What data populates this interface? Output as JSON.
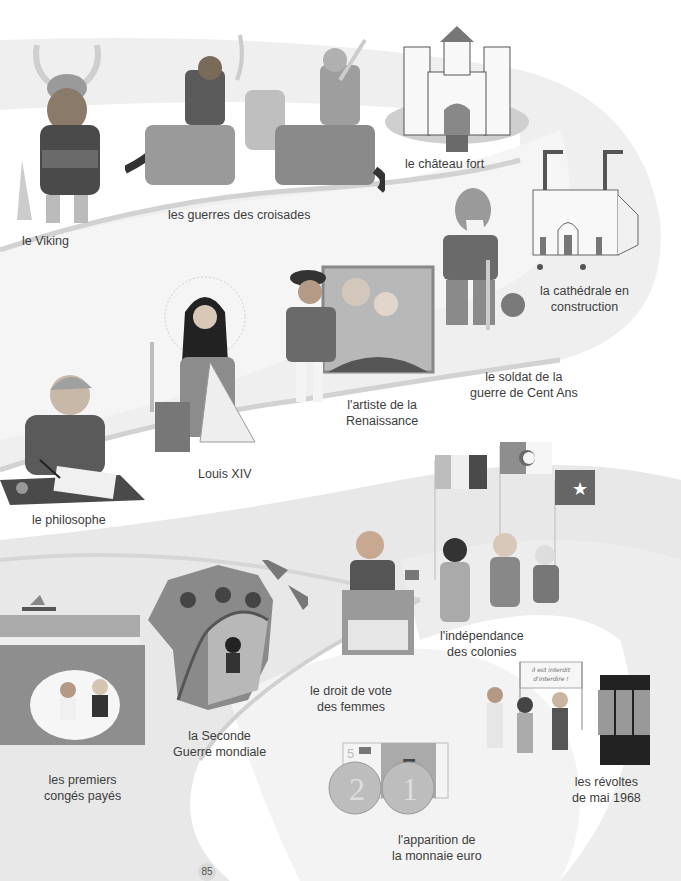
{
  "page": {
    "page_number": "85",
    "palette": {
      "road": "#e6e6e6",
      "road_edge": "#cfcfcf",
      "figure_dark": "#4a4a4a",
      "figure_mid": "#8c8c8c",
      "figure_light": "#bdbdbd"
    }
  },
  "timeline": [
    {
      "id": "viking",
      "label": "le Viking",
      "icon": "viking-icon"
    },
    {
      "id": "croisades",
      "label": "les guerres des croisades",
      "icon": "crusaders-icon"
    },
    {
      "id": "chateau",
      "label": "le château fort",
      "icon": "castle-icon"
    },
    {
      "id": "cathedrale",
      "label_line1": "la cathédrale en",
      "label_line2": "construction",
      "icon": "cathedral-icon"
    },
    {
      "id": "soldat",
      "label_line1": "le soldat de la",
      "label_line2": "guerre de Cent Ans",
      "icon": "soldier-icon"
    },
    {
      "id": "artiste",
      "label_line1": "l'artiste de la",
      "label_line2": "Renaissance",
      "icon": "artist-icon"
    },
    {
      "id": "louis",
      "label": "Louis XIV",
      "icon": "king-icon"
    },
    {
      "id": "philosophe",
      "label": "le philosophe",
      "icon": "philosopher-icon"
    },
    {
      "id": "independance",
      "label_line1": "l'indépendance",
      "label_line2": "des colonies",
      "icon": "flags-icon"
    },
    {
      "id": "vote",
      "label_line1": "le droit de vote",
      "label_line2": "des femmes",
      "icon": "ballot-box-icon"
    },
    {
      "id": "guerre",
      "label_line1": "la Seconde",
      "label_line2": "Guerre mondiale",
      "icon": "france-map-icon"
    },
    {
      "id": "conges",
      "label_line1": "les premiers",
      "label_line2": "congés payés",
      "icon": "beach-icon"
    },
    {
      "id": "mai68",
      "label_line1": "les révoltes",
      "label_line2": "de mai 1968",
      "icon": "protest-icon",
      "banner_text": "il est interdit d'interdire !"
    },
    {
      "id": "euro",
      "label_line1": "l'apparition de",
      "label_line2": "la monnaie euro",
      "icon": "euro-icon",
      "note_value": "5",
      "coins": [
        "2",
        "1"
      ]
    }
  ]
}
